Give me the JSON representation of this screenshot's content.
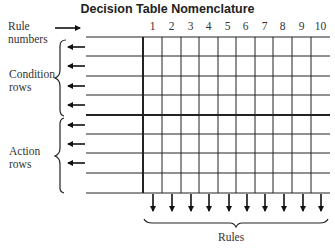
{
  "title": "Decision Table Nomenclature",
  "labels": {
    "rule_numbers": [
      "Rule",
      "numbers"
    ],
    "condition_rows": [
      "Condition",
      "rows"
    ],
    "action_rows": [
      "Action",
      "rows"
    ],
    "rules": "Rules"
  },
  "rule_numbers": [
    "1",
    "2",
    "3",
    "4",
    "5",
    "6",
    "7",
    "8",
    "9",
    "10"
  ],
  "structure": {
    "condition_row_count": 4,
    "action_row_count": 4,
    "rule_column_count": 10
  }
}
